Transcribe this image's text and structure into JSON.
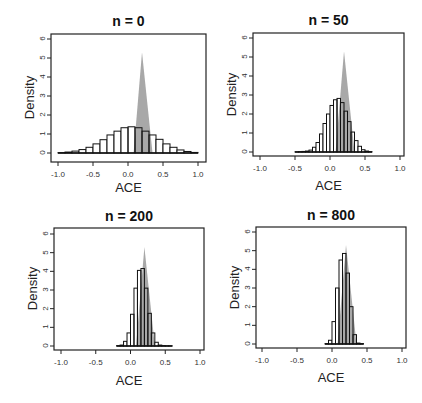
{
  "chart_data": [
    {
      "type": "bar",
      "subtype": "histogram-with-density",
      "title": "n = 0",
      "xlabel": "ACE",
      "ylabel": "Density",
      "xlim": [
        -1.0,
        1.0
      ],
      "ylim": [
        0,
        6
      ],
      "xticks": [
        "-1.0",
        "-0.5",
        "0.0",
        "0.5",
        "1.0"
      ],
      "yticks": [
        "0",
        "1",
        "2",
        "3",
        "4",
        "5",
        "6"
      ],
      "bin_width": 0.1,
      "bin_edges_start": -1.0,
      "values": [
        0.02,
        0.05,
        0.1,
        0.18,
        0.3,
        0.48,
        0.7,
        0.95,
        1.15,
        1.33,
        1.38,
        1.33,
        1.15,
        0.95,
        0.72,
        0.48,
        0.3,
        0.16,
        0.08,
        0.03
      ],
      "reference_density": {
        "peak_x": 0.2,
        "peak_y": 5.3,
        "base_left": 0.08,
        "base_right": 0.35,
        "color": "#a8a8a8"
      },
      "grid": false
    },
    {
      "type": "bar",
      "subtype": "histogram-with-density",
      "title": "n = 50",
      "xlabel": "ACE",
      "ylabel": "Density",
      "xlim": [
        -1.0,
        1.0
      ],
      "ylim": [
        0,
        6
      ],
      "xticks": [
        "-1.0",
        "-0.5",
        "0.0",
        "0.5",
        "1.0"
      ],
      "yticks": [
        "0",
        "1",
        "2",
        "3",
        "4",
        "5",
        "6"
      ],
      "bin_width": 0.05,
      "bin_edges_start": -0.5,
      "values": [
        0.01,
        0.02,
        0.03,
        0.05,
        0.1,
        0.25,
        0.5,
        0.95,
        1.5,
        2.0,
        2.45,
        2.75,
        2.82,
        2.6,
        2.15,
        1.6,
        1.05,
        0.6,
        0.3,
        0.12,
        0.05,
        0.02
      ],
      "reference_density": {
        "peak_x": 0.2,
        "peak_y": 5.3,
        "base_left": 0.08,
        "base_right": 0.35,
        "color": "#a8a8a8"
      },
      "grid": false
    },
    {
      "type": "bar",
      "subtype": "histogram-with-density",
      "title": "n = 200",
      "xlabel": "ACE",
      "ylabel": "Density",
      "xlim": [
        -1.0,
        1.0
      ],
      "ylim": [
        0,
        6
      ],
      "xticks": [
        "-1.0",
        "-0.5",
        "0.0",
        "0.5",
        "1.0"
      ],
      "yticks": [
        "0",
        "1",
        "2",
        "3",
        "4",
        "5",
        "6"
      ],
      "bin_width": 0.05,
      "bin_edges_start": -0.2,
      "values": [
        0.02,
        0.05,
        0.25,
        0.7,
        1.7,
        3.1,
        4.05,
        4.15,
        3.1,
        1.75,
        0.7,
        0.2,
        0.05,
        0.02,
        0.01,
        0.01
      ],
      "reference_density": {
        "peak_x": 0.2,
        "peak_y": 5.3,
        "base_left": 0.08,
        "base_right": 0.35,
        "color": "#a8a8a8"
      },
      "grid": false
    },
    {
      "type": "bar",
      "subtype": "histogram-with-density",
      "title": "n = 800",
      "xlabel": "ACE",
      "ylabel": "Density",
      "xlim": [
        -1.0,
        1.0
      ],
      "ylim": [
        0,
        6
      ],
      "xticks": [
        "-1.0",
        "-0.5",
        "0.0",
        "0.5",
        "1.0"
      ],
      "yticks": [
        "0",
        "1",
        "2",
        "3",
        "4",
        "5",
        "6"
      ],
      "bin_width": 0.05,
      "bin_edges_start": -0.1,
      "values": [
        0.02,
        0.2,
        1.2,
        3.0,
        4.5,
        4.85,
        3.8,
        2.0,
        0.5,
        0.05,
        0.02
      ],
      "reference_density": {
        "peak_x": 0.2,
        "peak_y": 5.3,
        "base_left": 0.08,
        "base_right": 0.35,
        "color": "#a8a8a8"
      },
      "grid": false
    }
  ],
  "layout": {
    "panels": [
      {
        "left": 51,
        "top": 34,
        "right": 206,
        "bottom": 162,
        "x_min_px": 58,
        "x_max_px": 198,
        "y0_px": 153,
        "y6_px": 39,
        "title_y": 13,
        "xlabel_y": 180
      },
      {
        "left": 253,
        "top": 33,
        "right": 404,
        "bottom": 156,
        "x_min_px": 260,
        "x_max_px": 400,
        "y0_px": 152,
        "y6_px": 38,
        "title_y": 12,
        "xlabel_y": 178
      },
      {
        "left": 54,
        "top": 228,
        "right": 204,
        "bottom": 350,
        "x_min_px": 61,
        "x_max_px": 200,
        "y0_px": 346,
        "y6_px": 234,
        "title_y": 208,
        "xlabel_y": 373
      },
      {
        "left": 256,
        "top": 227,
        "right": 406,
        "bottom": 348,
        "x_min_px": 262,
        "x_max_px": 402,
        "y0_px": 344,
        "y6_px": 232,
        "title_y": 207,
        "xlabel_y": 370
      }
    ],
    "colors": {
      "bar_fill": "#ffffff",
      "bar_stroke": "#111111",
      "density_fill": "#a8a8a8",
      "frame": "#222222"
    }
  }
}
